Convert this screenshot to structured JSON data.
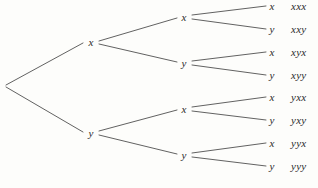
{
  "figure": {
    "type": "probability-tree-diagram",
    "width": 318,
    "height": 188,
    "background_color": "#fdfdfb",
    "ink_color": "#3a3a3a",
    "text_color": "#2b2b2b"
  },
  "root": {
    "label": "",
    "x": 6,
    "y": 85
  },
  "level1": [
    {
      "id": "x",
      "label": "x",
      "x": 91,
      "y": 42
    },
    {
      "id": "y",
      "label": "y",
      "x": 91,
      "y": 133
    }
  ],
  "level2": [
    {
      "id": "xx",
      "label": "x",
      "x": 184,
      "y": 17
    },
    {
      "id": "xy",
      "label": "y",
      "x": 184,
      "y": 63
    },
    {
      "id": "yx",
      "label": "x",
      "x": 184,
      "y": 109
    },
    {
      "id": "yy",
      "label": "y",
      "x": 184,
      "y": 155
    }
  ],
  "level3": [
    {
      "id": "xxx",
      "label": "x",
      "outcome": "xxx",
      "x": 272,
      "y": 6,
      "outcome_x": 291
    },
    {
      "id": "xxy",
      "label": "y",
      "outcome": "xxy",
      "x": 272,
      "y": 29,
      "outcome_x": 291
    },
    {
      "id": "xyx",
      "label": "x",
      "outcome": "xyx",
      "x": 272,
      "y": 52,
      "outcome_x": 291
    },
    {
      "id": "xyy",
      "label": "y",
      "outcome": "xyy",
      "x": 272,
      "y": 75,
      "outcome_x": 291
    },
    {
      "id": "yxx",
      "label": "x",
      "outcome": "yxx",
      "x": 272,
      "y": 97,
      "outcome_x": 291
    },
    {
      "id": "yxy",
      "label": "y",
      "outcome": "yxy",
      "x": 272,
      "y": 120,
      "outcome_x": 291
    },
    {
      "id": "yyx",
      "label": "x",
      "outcome": "yyx",
      "x": 272,
      "y": 143,
      "outcome_x": 291
    },
    {
      "id": "yyy",
      "label": "y",
      "outcome": "yyy",
      "x": 272,
      "y": 166,
      "outcome_x": 291
    }
  ],
  "edges": [
    {
      "id": "root-x",
      "x1": 6,
      "y1": 85,
      "x2": 83,
      "y2": 43
    },
    {
      "id": "root-y",
      "x1": 6,
      "y1": 87,
      "x2": 83,
      "y2": 132
    },
    {
      "id": "x-xx",
      "x1": 99,
      "y1": 41,
      "x2": 177,
      "y2": 18
    },
    {
      "id": "x-xy",
      "x1": 99,
      "y1": 44,
      "x2": 177,
      "y2": 62
    },
    {
      "id": "y-yx",
      "x1": 99,
      "y1": 131,
      "x2": 177,
      "y2": 110
    },
    {
      "id": "y-yy",
      "x1": 99,
      "y1": 135,
      "x2": 177,
      "y2": 154
    },
    {
      "id": "xx-xxx",
      "x1": 192,
      "y1": 15,
      "x2": 266,
      "y2": 6
    },
    {
      "id": "xx-xxy",
      "x1": 192,
      "y1": 19,
      "x2": 266,
      "y2": 29
    },
    {
      "id": "xy-xyx",
      "x1": 192,
      "y1": 61,
      "x2": 266,
      "y2": 52
    },
    {
      "id": "xy-xyy",
      "x1": 192,
      "y1": 65,
      "x2": 266,
      "y2": 75
    },
    {
      "id": "yx-yxx",
      "x1": 192,
      "y1": 107,
      "x2": 266,
      "y2": 97
    },
    {
      "id": "yx-yxy",
      "x1": 192,
      "y1": 111,
      "x2": 266,
      "y2": 120
    },
    {
      "id": "yy-yyx",
      "x1": 192,
      "y1": 153,
      "x2": 266,
      "y2": 143
    },
    {
      "id": "yy-yyy",
      "x1": 192,
      "y1": 157,
      "x2": 266,
      "y2": 166
    }
  ]
}
